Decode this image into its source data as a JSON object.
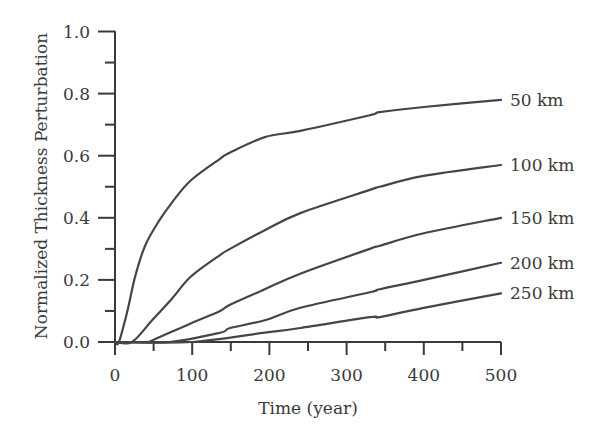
{
  "chart_data": {
    "type": "line",
    "title": "",
    "xlabel": "Time (year)",
    "ylabel": "Normalized Thickness Perturbation",
    "xlim": [
      0,
      500
    ],
    "ylim": [
      0,
      1.0
    ],
    "x_major_ticks": [
      0,
      100,
      200,
      300,
      400,
      500
    ],
    "x_minor_ticks": [
      50,
      150,
      250,
      350,
      450
    ],
    "x_tick_labels": [
      "0",
      "100",
      "200",
      "300",
      "400",
      "500"
    ],
    "y_major_ticks": [
      0.0,
      0.2,
      0.4,
      0.6,
      0.8,
      1.0
    ],
    "y_minor_ticks": [
      0.1,
      0.3,
      0.5,
      0.7,
      0.9
    ],
    "y_tick_labels": [
      "0.0",
      "0.2",
      "0.4",
      "0.6",
      "0.8",
      "1.0"
    ],
    "grid": false,
    "legend": "inline labels at right end of each curve",
    "series": [
      {
        "name": "50 km",
        "x": [
          0,
          5,
          16,
          26,
          39,
          57,
          74,
          98,
          136,
          149,
          194,
          240,
          330,
          343,
          400,
          500
        ],
        "values": [
          0,
          0,
          0.1,
          0.21,
          0.31,
          0.39,
          0.45,
          0.52,
          0.59,
          0.61,
          0.66,
          0.68,
          0.73,
          0.74,
          0.757,
          0.78
        ]
      },
      {
        "name": "100 km",
        "x": [
          0,
          22,
          48,
          74,
          98,
          136,
          149,
          194,
          240,
          330,
          343,
          400,
          500
        ],
        "values": [
          0,
          0,
          0.07,
          0.14,
          0.21,
          0.28,
          0.3,
          0.36,
          0.415,
          0.49,
          0.5,
          0.535,
          0.57
        ]
      },
      {
        "name": "150 km",
        "x": [
          0,
          40,
          48,
          98,
          136,
          149,
          194,
          240,
          330,
          343,
          400,
          500
        ],
        "values": [
          0,
          0,
          0.005,
          0.06,
          0.1,
          0.12,
          0.17,
          0.22,
          0.3,
          0.31,
          0.35,
          0.4
        ]
      },
      {
        "name": "200 km",
        "x": [
          0,
          70,
          136,
          149,
          194,
          240,
          330,
          343,
          400,
          500
        ],
        "values": [
          0,
          0,
          0.03,
          0.045,
          0.07,
          0.11,
          0.16,
          0.17,
          0.2,
          0.255
        ]
      },
      {
        "name": "250 km",
        "x": [
          0,
          100,
          194,
          240,
          330,
          343,
          400,
          500
        ],
        "values": [
          0,
          0,
          0.03,
          0.045,
          0.08,
          0.08,
          0.11,
          0.157
        ]
      }
    ]
  },
  "labels": {
    "series": [
      "50 km",
      "100 km",
      "150 km",
      "200 km",
      "250 km"
    ]
  },
  "colors": {
    "axis": "#3a3a3a",
    "curve": "#454545",
    "background": "#ffffff"
  }
}
